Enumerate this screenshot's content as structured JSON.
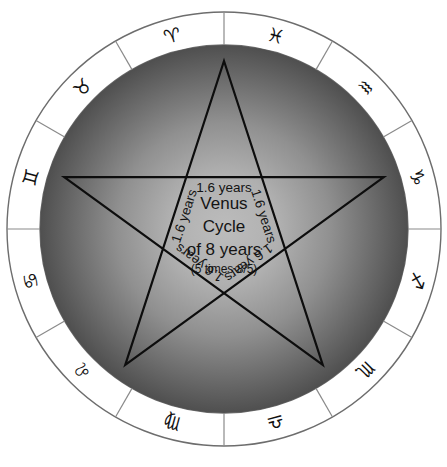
{
  "figure": {
    "background_color": "#ffffff"
  },
  "center_text": {
    "line1": "Venus",
    "line2": "Cycle",
    "line3": "of 8 years",
    "line4": "(5 times 8/5)"
  },
  "spoke_labels": [
    {
      "text": "1.6 years"
    },
    {
      "text": "1.6 years"
    },
    {
      "text": "1.6 years"
    },
    {
      "text": "1.6 years"
    },
    {
      "text": "1.6 years"
    }
  ],
  "zodiac_ring": {
    "order": "counterclockwise",
    "signs": [
      {
        "name": "Aries",
        "glyph": "♈"
      },
      {
        "name": "Taurus",
        "glyph": "♉"
      },
      {
        "name": "Gemini",
        "glyph": "♊"
      },
      {
        "name": "Cancer",
        "glyph": "♋"
      },
      {
        "name": "Leo",
        "glyph": "♌"
      },
      {
        "name": "Virgo",
        "glyph": "♍"
      },
      {
        "name": "Libra",
        "glyph": "♎"
      },
      {
        "name": "Scorpio",
        "glyph": "♏"
      },
      {
        "name": "Sagittarius",
        "glyph": "♐"
      },
      {
        "name": "Capricorn",
        "glyph": "♑"
      },
      {
        "name": "Aquarius",
        "glyph": "♒"
      },
      {
        "name": "Pisces",
        "glyph": "♓"
      }
    ]
  },
  "colors": {
    "disc_center": "#b4b4b4",
    "disc_edge": "#555555",
    "ring_fill": "#ffffff",
    "ring_stroke": "#6d6d6d",
    "pentagram_stroke": "#0d0d0d",
    "text": "#141414"
  },
  "geometry": {
    "center_x": 224,
    "center_y": 229,
    "outer_radius": 217,
    "inner_radius": 184,
    "pentagram_radius": 168
  }
}
